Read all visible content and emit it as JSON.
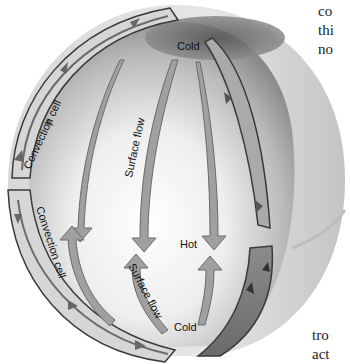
{
  "diagram": {
    "type": "convection-cells-on-sphere",
    "labels": {
      "cold_top": "Cold",
      "cold_bottom": "Cold",
      "hot": "Hot",
      "surface_flow_upper": "Surface flow",
      "surface_flow_lower": "Surface flow",
      "convection_cell_upper": "Convection cell",
      "convection_cell_lower": "Convection cell"
    },
    "colors": {
      "background": "#ffffff",
      "sphere_light": "#f4f4f4",
      "sphere_dark": "#7a7a7a",
      "arrow_fill": "#9a9a9a",
      "arrow_stroke": "#6a6a6a",
      "cell_outline": "#3a3a3a",
      "label": "#111111"
    }
  },
  "side_text": {
    "top_lines": [
      "co",
      "thi",
      "no"
    ],
    "bottom_lines": [
      "tro",
      "act"
    ]
  }
}
